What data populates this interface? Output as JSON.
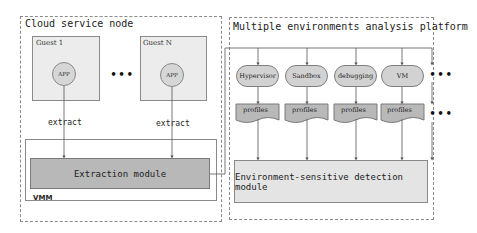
{
  "left_container": {
    "title": "Cloud service node",
    "guests": [
      {
        "label": "Guest 1",
        "app_label": "APP",
        "edge_label": "extract"
      },
      {
        "label": "Guest N",
        "app_label": "APP",
        "edge_label": "extract"
      }
    ],
    "ellipsis": "•••",
    "vmm_label": "VMM",
    "extraction_module": "Extraction module"
  },
  "right_container": {
    "title": "Multiple environments analysis platform",
    "environments": [
      {
        "label": "Hypervisor",
        "profile": "profiles"
      },
      {
        "label": "Sandbox",
        "profile": "profiles"
      },
      {
        "label": "debugging",
        "profile": "profiles"
      },
      {
        "label": "VM",
        "profile": "profiles"
      }
    ],
    "ellipsis": "•••",
    "detection_module": "Environment-sensitive detection module"
  },
  "colors": {
    "dark_fill": "#b8b8b8",
    "light_fill": "#e4e4e4",
    "guest_fill": "#ececec",
    "line": "#555555"
  }
}
